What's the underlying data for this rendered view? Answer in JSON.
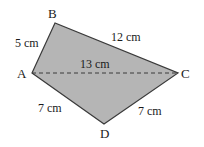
{
  "figure": {
    "shape": "quadrilateral",
    "fill_color": "#b5b5b5",
    "stroke_color": "#3a3a3a",
    "vertices": {
      "A": "A",
      "B": "B",
      "C": "C",
      "D": "D"
    },
    "sides": {
      "AB": "5 cm",
      "BC": "12 cm",
      "CD": "7 cm",
      "DA": "7 cm"
    },
    "diagonal": {
      "AC": "13 cm",
      "style": "dashed"
    }
  }
}
